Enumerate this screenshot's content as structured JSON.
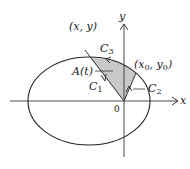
{
  "figure": {
    "type": "ellipse sector area diagram",
    "axes": {
      "x_label": "x",
      "y_label": "y",
      "origin_label": "0"
    },
    "points": {
      "moving_point": "(x, y)",
      "fixed_point_x": "x",
      "fixed_point_sub": "0",
      "fixed_point_y": "y"
    },
    "region_label": "A(t)",
    "curves": {
      "c1": {
        "letter": "C",
        "sub": "1"
      },
      "c2": {
        "letter": "C",
        "sub": "2"
      },
      "c3": {
        "letter": "C",
        "sub": "3"
      }
    },
    "colors": {
      "line": "#222222",
      "shade": "#c8c8c8",
      "background": "#ffffff"
    }
  }
}
